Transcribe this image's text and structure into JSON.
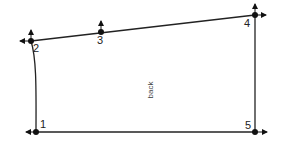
{
  "diagram": {
    "type": "pattern-draft",
    "piece_label": "back",
    "colors": {
      "line": "#222222",
      "point": "#111111",
      "background": "#ffffff"
    },
    "points": [
      {
        "id": "1",
        "label": "1",
        "x": 36,
        "y": 132,
        "arrows": [
          "left"
        ]
      },
      {
        "id": "2",
        "label": "2",
        "x": 31,
        "y": 41,
        "arrows": [
          "up",
          "left"
        ]
      },
      {
        "id": "3",
        "label": "3",
        "x": 101,
        "y": 32,
        "arrows": [
          "up"
        ]
      },
      {
        "id": "4",
        "label": "4",
        "x": 255,
        "y": 15,
        "arrows": [
          "up",
          "right"
        ]
      },
      {
        "id": "5",
        "label": "5",
        "x": 255,
        "y": 132,
        "arrows": [
          "right"
        ]
      }
    ],
    "edges": [
      {
        "from": "1",
        "to": "2",
        "style": "curve"
      },
      {
        "from": "2",
        "to": "3",
        "style": "straight"
      },
      {
        "from": "3",
        "to": "4",
        "style": "straight"
      },
      {
        "from": "4",
        "to": "5",
        "style": "straight"
      },
      {
        "from": "5",
        "to": "1",
        "style": "straight"
      }
    ]
  }
}
